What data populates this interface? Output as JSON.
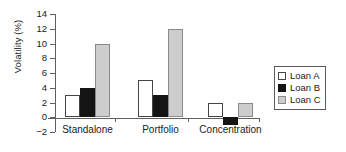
{
  "chart_data": {
    "type": "bar",
    "title": "",
    "xlabel": "",
    "ylabel": "Volatility (%)",
    "categories": [
      "Standalone",
      "Portfolio",
      "Concentration"
    ],
    "series": [
      {
        "name": "Loan A",
        "color": "#ffffff",
        "values": [
          3,
          5,
          2
        ]
      },
      {
        "name": "Loan B",
        "color": "#141414",
        "values": [
          4,
          3,
          -1
        ]
      },
      {
        "name": "Loan C",
        "color": "#cdcdcd",
        "values": [
          10,
          12,
          2
        ]
      }
    ],
    "ylim": [
      -2,
      14
    ],
    "ytick_labels": [
      "14",
      "12",
      "10",
      "8",
      "6",
      "4",
      "2",
      "0",
      "−2"
    ],
    "ytick_values": [
      14,
      12,
      10,
      8,
      6,
      4,
      2,
      0,
      -2
    ],
    "grid": false,
    "legend_position": "right",
    "legend_entries": [
      "Loan A",
      "Loan B",
      "Loan C"
    ]
  }
}
